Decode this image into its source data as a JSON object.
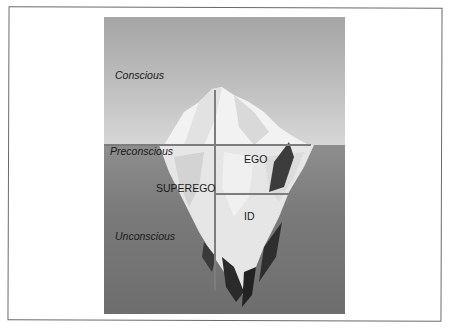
{
  "figure": {
    "levels": {
      "conscious": "Conscious",
      "preconscious": "Preconscious",
      "unconscious": "Unconscious"
    },
    "structures": {
      "ego": "EGO",
      "superego": "SUPEREGO",
      "id": "ID"
    },
    "colors": {
      "sky": "#bdbdbd",
      "sea": "#7a7a7a",
      "ice": "#eeeeee",
      "divider": "#7d7d7d"
    }
  }
}
